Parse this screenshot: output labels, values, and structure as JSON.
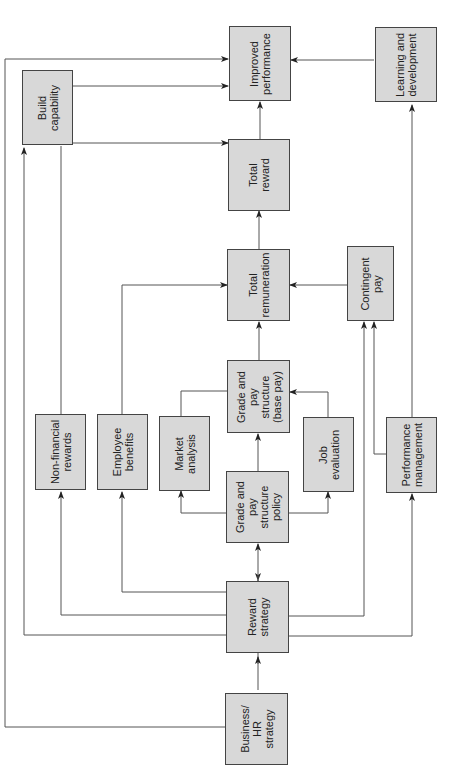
{
  "diagram": {
    "type": "flowchart",
    "orientation": "rotated-90-ccw",
    "colors": {
      "box_fill": "#d8d8d8",
      "box_border": "#444444",
      "line": "#555555"
    },
    "nodes": [
      {
        "id": "improved",
        "label": "Improved\nperformance"
      },
      {
        "id": "learning",
        "label": "Learning and\ndevelopment"
      },
      {
        "id": "build",
        "label": "Build\ncapability"
      },
      {
        "id": "total_reward",
        "label": "Total\nreward"
      },
      {
        "id": "total_rem",
        "label": "Total\nremuneration"
      },
      {
        "id": "contingent",
        "label": "Contingent\npay"
      },
      {
        "id": "nonfin",
        "label": "Non-financial\nrewards"
      },
      {
        "id": "benefits",
        "label": "Employee\nbenefits"
      },
      {
        "id": "market",
        "label": "Market\nanalysis"
      },
      {
        "id": "grade_base",
        "label": "Grade and\npay\nstructure\n(base pay)"
      },
      {
        "id": "job_eval",
        "label": "Job\nevaluation"
      },
      {
        "id": "perf_mgmt",
        "label": "Performance\nmanagement"
      },
      {
        "id": "grade_policy",
        "label": "Grade and\npay\nstructure\npolicy"
      },
      {
        "id": "reward_strategy",
        "label": "Reward\nstrategy"
      },
      {
        "id": "business",
        "label": "Business/\nHR\nstrategy"
      }
    ],
    "edges": [
      [
        "business",
        "reward_strategy"
      ],
      [
        "business",
        "improved"
      ],
      [
        "reward_strategy",
        "grade_policy"
      ],
      [
        "reward_strategy",
        "nonfin"
      ],
      [
        "reward_strategy",
        "benefits"
      ],
      [
        "reward_strategy",
        "build"
      ],
      [
        "reward_strategy",
        "contingent"
      ],
      [
        "reward_strategy",
        "perf_mgmt"
      ],
      [
        "grade_policy",
        "grade_base"
      ],
      [
        "grade_policy",
        "market"
      ],
      [
        "grade_policy",
        "job_eval"
      ],
      [
        "market",
        "grade_base"
      ],
      [
        "job_eval",
        "grade_base"
      ],
      [
        "grade_base",
        "total_rem"
      ],
      [
        "benefits",
        "total_rem"
      ],
      [
        "contingent",
        "total_rem"
      ],
      [
        "perf_mgmt",
        "contingent"
      ],
      [
        "perf_mgmt",
        "learning"
      ],
      [
        "total_rem",
        "total_reward"
      ],
      [
        "nonfin",
        "total_reward"
      ],
      [
        "build",
        "total_reward"
      ],
      [
        "build",
        "improved"
      ],
      [
        "total_reward",
        "improved"
      ],
      [
        "learning",
        "improved"
      ]
    ]
  }
}
